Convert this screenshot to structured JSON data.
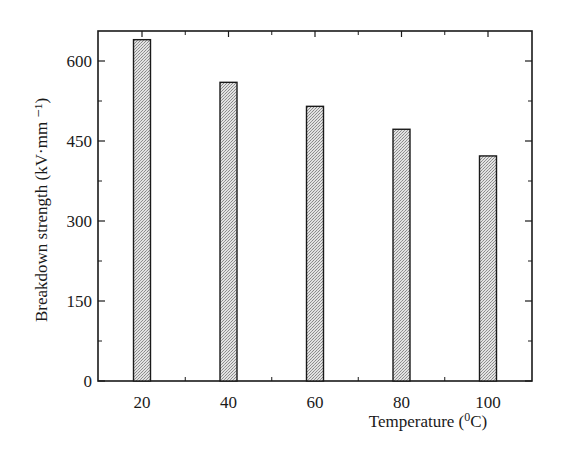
{
  "chart_data": {
    "type": "bar",
    "title": "",
    "xlabel": "Temperature (⁰C)",
    "ylabel": "Breakdown strength (kV·mm⁻¹)",
    "categories": [
      "20",
      "40",
      "60",
      "80",
      "100"
    ],
    "values": [
      640,
      560,
      515,
      472,
      422
    ],
    "ylim": [
      0,
      650
    ],
    "xlim": [
      10,
      110
    ],
    "yticks": [
      0,
      150,
      300,
      450,
      600
    ],
    "xticks": [
      20,
      40,
      60,
      80,
      100
    ],
    "grid": false,
    "legend": null,
    "bar_fill": "crosshatch-gray",
    "bar_edge_color": "#1a1a1a"
  },
  "axes": {
    "x_label": "Temperature",
    "x_unit": "(⁰C)",
    "y_label": "Breakdown  strength  (kV·mm ⁻¹)"
  }
}
